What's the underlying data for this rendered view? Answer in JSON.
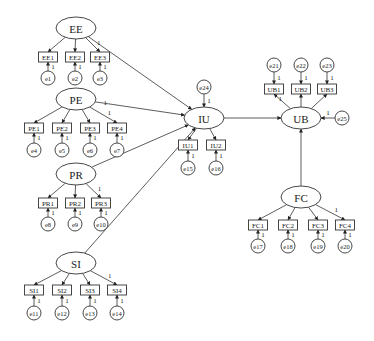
{
  "diagram": {
    "type": "structural-equation-model",
    "latent_variables": [
      {
        "id": "EE",
        "label": "EE",
        "cx": 76,
        "cy": 28,
        "rx": 20,
        "ry": 11
      },
      {
        "id": "PE",
        "label": "PE",
        "cx": 76,
        "cy": 99,
        "rx": 20,
        "ry": 11
      },
      {
        "id": "PR",
        "label": "PR",
        "cx": 76,
        "cy": 174,
        "rx": 20,
        "ry": 11
      },
      {
        "id": "SI",
        "label": "SI",
        "cx": 76,
        "cy": 263,
        "rx": 20,
        "ry": 11
      },
      {
        "id": "IU",
        "label": "IU",
        "cx": 204,
        "cy": 118,
        "rx": 20,
        "ry": 11
      },
      {
        "id": "UB",
        "label": "UB",
        "cx": 301,
        "cy": 118,
        "rx": 20,
        "ry": 11
      },
      {
        "id": "FC",
        "label": "FC",
        "cx": 301,
        "cy": 197,
        "rx": 20,
        "ry": 11
      }
    ],
    "observed_variables": [
      {
        "id": "EE1",
        "label": "EE1",
        "cx": 48,
        "cy": 57,
        "latent": "EE",
        "error": "e1",
        "fixed": false
      },
      {
        "id": "EE2",
        "label": "EE2",
        "cx": 75,
        "cy": 57,
        "latent": "EE",
        "error": "e2",
        "fixed": false
      },
      {
        "id": "EE3",
        "label": "EE3",
        "cx": 100,
        "cy": 57,
        "latent": "EE",
        "error": "e3",
        "fixed": true
      },
      {
        "id": "PE1",
        "label": "PE1",
        "cx": 34,
        "cy": 128,
        "latent": "PE",
        "error": "e4",
        "fixed": false
      },
      {
        "id": "PE2",
        "label": "PE2",
        "cx": 62,
        "cy": 128,
        "latent": "PE",
        "error": "e5",
        "fixed": false
      },
      {
        "id": "PE3",
        "label": "PE3",
        "cx": 90,
        "cy": 128,
        "latent": "PE",
        "error": "e6",
        "fixed": false
      },
      {
        "id": "PE4",
        "label": "PE4",
        "cx": 117,
        "cy": 128,
        "latent": "PE",
        "error": "e7",
        "fixed": true
      },
      {
        "id": "PR1",
        "label": "PR1",
        "cx": 48,
        "cy": 203,
        "latent": "PR",
        "error": "e8",
        "fixed": false
      },
      {
        "id": "PR2",
        "label": "PR2",
        "cx": 75,
        "cy": 203,
        "latent": "PR",
        "error": "e9",
        "fixed": false
      },
      {
        "id": "PR3",
        "label": "PR3",
        "cx": 101,
        "cy": 203,
        "latent": "PR",
        "error": "e10",
        "fixed": true
      },
      {
        "id": "SI1",
        "label": "SI1",
        "cx": 34,
        "cy": 290,
        "latent": "SI",
        "error": "e11",
        "fixed": false
      },
      {
        "id": "SI2",
        "label": "SI2",
        "cx": 62,
        "cy": 290,
        "latent": "SI",
        "error": "e12",
        "fixed": false
      },
      {
        "id": "SI3",
        "label": "SI3",
        "cx": 90,
        "cy": 290,
        "latent": "SI",
        "error": "e13",
        "fixed": false
      },
      {
        "id": "SI4",
        "label": "SI4",
        "cx": 117,
        "cy": 290,
        "latent": "SI",
        "error": "e14",
        "fixed": true
      },
      {
        "id": "IU1",
        "label": "IU1",
        "cx": 188,
        "cy": 145,
        "latent": "IU",
        "error": "e15",
        "fixed": false
      },
      {
        "id": "IU2",
        "label": "IU2",
        "cx": 216,
        "cy": 145,
        "latent": "IU",
        "error": "e16",
        "fixed": false
      },
      {
        "id": "UB1",
        "label": "UB1",
        "cx": 274,
        "cy": 89,
        "latent": "UB",
        "error": "e21",
        "fixed": true
      },
      {
        "id": "UB2",
        "label": "UB2",
        "cx": 301,
        "cy": 89,
        "latent": "UB",
        "error": "e22",
        "fixed": false
      },
      {
        "id": "UB3",
        "label": "UB3",
        "cx": 327,
        "cy": 89,
        "latent": "UB",
        "error": "e23",
        "fixed": false
      },
      {
        "id": "FC1",
        "label": "FC1",
        "cx": 258,
        "cy": 225,
        "latent": "FC",
        "error": "e17",
        "fixed": false
      },
      {
        "id": "FC2",
        "label": "FC2",
        "cx": 288,
        "cy": 225,
        "latent": "FC",
        "error": "e18",
        "fixed": false
      },
      {
        "id": "FC3",
        "label": "FC3",
        "cx": 318,
        "cy": 225,
        "latent": "FC",
        "error": "e19",
        "fixed": false
      },
      {
        "id": "FC4",
        "label": "FC4",
        "cx": 345,
        "cy": 225,
        "latent": "FC",
        "error": "e20",
        "fixed": true
      }
    ],
    "error_terms": [
      {
        "id": "e1",
        "label": "e1",
        "cx": 48,
        "cy": 78,
        "target": "EE1"
      },
      {
        "id": "e2",
        "label": "e2",
        "cx": 75,
        "cy": 78,
        "target": "EE2"
      },
      {
        "id": "e3",
        "label": "e3",
        "cx": 100,
        "cy": 78,
        "target": "EE3"
      },
      {
        "id": "e4",
        "label": "e4",
        "cx": 34,
        "cy": 150,
        "target": "PE1"
      },
      {
        "id": "e5",
        "label": "e5",
        "cx": 62,
        "cy": 150,
        "target": "PE2"
      },
      {
        "id": "e6",
        "label": "e6",
        "cx": 90,
        "cy": 150,
        "target": "PE3"
      },
      {
        "id": "e7",
        "label": "e7",
        "cx": 117,
        "cy": 150,
        "target": "PE4"
      },
      {
        "id": "e8",
        "label": "e8",
        "cx": 48,
        "cy": 224,
        "target": "PR1"
      },
      {
        "id": "e9",
        "label": "e9",
        "cx": 75,
        "cy": 224,
        "target": "PR2"
      },
      {
        "id": "e10",
        "label": "e10",
        "cx": 101,
        "cy": 224,
        "target": "PR3"
      },
      {
        "id": "e11",
        "label": "e11",
        "cx": 34,
        "cy": 313,
        "target": "SI1"
      },
      {
        "id": "e12",
        "label": "e12",
        "cx": 62,
        "cy": 313,
        "target": "SI2"
      },
      {
        "id": "e13",
        "label": "e13",
        "cx": 90,
        "cy": 313,
        "target": "SI3"
      },
      {
        "id": "e14",
        "label": "e14",
        "cx": 117,
        "cy": 313,
        "target": "SI4"
      },
      {
        "id": "e15",
        "label": "e15",
        "cx": 188,
        "cy": 168,
        "target": "IU1"
      },
      {
        "id": "e16",
        "label": "e16",
        "cx": 216,
        "cy": 168,
        "target": "IU2"
      },
      {
        "id": "e17",
        "label": "e17",
        "cx": 258,
        "cy": 246,
        "target": "FC1"
      },
      {
        "id": "e18",
        "label": "e18",
        "cx": 288,
        "cy": 246,
        "target": "FC2"
      },
      {
        "id": "e19",
        "label": "e19",
        "cx": 318,
        "cy": 246,
        "target": "FC3"
      },
      {
        "id": "e20",
        "label": "e20",
        "cx": 345,
        "cy": 246,
        "target": "FC4"
      },
      {
        "id": "e21",
        "label": "e21",
        "cx": 274,
        "cy": 65,
        "target": "UB1"
      },
      {
        "id": "e22",
        "label": "e22",
        "cx": 301,
        "cy": 65,
        "target": "UB2"
      },
      {
        "id": "e23",
        "label": "e23",
        "cx": 327,
        "cy": 65,
        "target": "UB3"
      },
      {
        "id": "e24",
        "label": "e24",
        "cx": 204,
        "cy": 87,
        "target": "IU"
      },
      {
        "id": "e25",
        "label": "e25",
        "cx": 342,
        "cy": 118,
        "target": "UB"
      }
    ],
    "structural_paths": [
      {
        "from": "EE",
        "to": "IU"
      },
      {
        "from": "PE",
        "to": "IU",
        "coef": "1"
      },
      {
        "from": "PR",
        "to": "IU"
      },
      {
        "from": "SI",
        "to": "IU"
      },
      {
        "from": "IU",
        "to": "UB"
      },
      {
        "from": "FC",
        "to": "UB"
      }
    ],
    "fixed_coefficient_label": "1"
  }
}
